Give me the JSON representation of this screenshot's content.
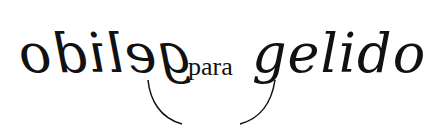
{
  "artwork": {
    "left_word": "gelido",
    "left_word_mirrored": true,
    "middle_word": "para",
    "right_word": "gelido",
    "ink_color": "#111111",
    "background_color": "#ffffff"
  }
}
